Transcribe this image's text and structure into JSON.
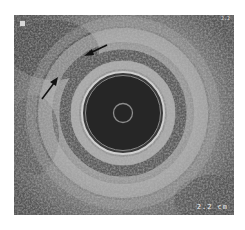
{
  "image": {
    "type": "endoscopic ultrasound",
    "scale_label": "2.2 cm",
    "top_right_label": "2.2",
    "marker": "square-marker",
    "annotations": [
      {
        "type": "arrow",
        "direction": "pointing down-left",
        "label": ""
      },
      {
        "type": "arrow",
        "direction": "pointing up-right",
        "label": ""
      }
    ],
    "colors": {
      "background": "#ffffff",
      "tissue": "#6a6a6a",
      "lumen": "#262626",
      "balloon_ring": "#c8c8c8",
      "arrow": "#111111"
    }
  }
}
